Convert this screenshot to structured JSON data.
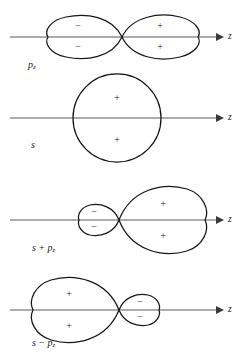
{
  "figure": {
    "background_color": "#ffffff",
    "outline_color": "#161616",
    "axis_color": "#5a5a5a",
    "text_color": "#1a1a1a",
    "width": 242,
    "height": 361
  },
  "panels": [
    {
      "id": "pz",
      "label_main": "p",
      "label_sub": "z",
      "label_op": "",
      "label_text": "pz",
      "axis_label": "z",
      "axis_y": 37,
      "axis_x_start": 10,
      "axis_x_end": 222,
      "label_x": 28,
      "label_y": 66,
      "shape": "figure-eight",
      "crossing_x": 122,
      "left_lobe": {
        "sign_top": "−",
        "sign_bottom": "−",
        "sign_top_x": 78,
        "sign_top_y": 27,
        "sign_bottom_x": 78,
        "sign_bottom_y": 48,
        "tip_x": 48,
        "half_height": 22
      },
      "right_lobe": {
        "sign_top": "+",
        "sign_bottom": "+",
        "sign_top_x": 160,
        "sign_top_y": 27,
        "sign_bottom_x": 160,
        "sign_bottom_y": 48,
        "tip_x": 194,
        "half_height": 22
      }
    },
    {
      "id": "s",
      "label_main": "s",
      "label_sub": "",
      "label_op": "",
      "label_text": "s",
      "axis_label": "z",
      "axis_y": 118,
      "axis_x_start": 10,
      "axis_x_end": 222,
      "label_x": 31,
      "label_y": 146,
      "shape": "circle",
      "circle_cx": 117,
      "circle_cy": 118,
      "circle_r": 44,
      "sign_top": "+",
      "sign_bottom": "+",
      "sign_top_x": 117,
      "sign_top_y": 99,
      "sign_bottom_x": 117,
      "sign_bottom_y": 141
    },
    {
      "id": "s-plus-pz",
      "label_main": "s",
      "label_op": "+",
      "label_second": "p",
      "label_sub": "z",
      "label_text": "s + pz",
      "axis_label": "z",
      "axis_y": 220,
      "axis_x_start": 10,
      "axis_x_end": 222,
      "label_x": 32,
      "label_y": 249,
      "shape": "figure-eight-asymmetric",
      "crossing_x": 119,
      "left_lobe": {
        "sign_top": "−",
        "sign_bottom": "−",
        "sign_top_x": 94,
        "sign_top_y": 213,
        "sign_bottom_x": 94,
        "sign_bottom_y": 228,
        "tip_x": 79,
        "half_height": 13
      },
      "right_lobe": {
        "sign_top": "+",
        "sign_bottom": "+",
        "sign_top_x": 163,
        "sign_top_y": 205,
        "sign_bottom_x": 163,
        "sign_bottom_y": 237,
        "tip_x": 205,
        "half_height": 32
      }
    },
    {
      "id": "s-minus-pz",
      "label_main": "s",
      "label_op": "−",
      "label_second": "p",
      "label_sub": "z",
      "label_text": "s − pz",
      "axis_label": "z",
      "axis_y": 310,
      "axis_x_start": 10,
      "axis_x_end": 222,
      "label_x": 32,
      "label_y": 344,
      "shape": "figure-eight-asymmetric-mirrored",
      "crossing_x": 119,
      "left_lobe": {
        "sign_top": "+",
        "sign_bottom": "+",
        "sign_top_x": 69,
        "sign_top_y": 295,
        "sign_bottom_x": 69,
        "sign_bottom_y": 327,
        "tip_x": 33,
        "half_height": 31
      },
      "right_lobe": {
        "sign_top": "−",
        "sign_bottom": "−",
        "sign_top_x": 140,
        "sign_top_y": 303,
        "sign_bottom_x": 140,
        "sign_bottom_y": 318,
        "tip_x": 158,
        "half_height": 13
      }
    }
  ],
  "axis_labels": [
    {
      "text": "z",
      "x": 228,
      "y": 37
    },
    {
      "text": "z",
      "x": 228,
      "y": 118
    },
    {
      "text": "z",
      "x": 228,
      "y": 220
    },
    {
      "text": "z",
      "x": 228,
      "y": 310
    }
  ]
}
